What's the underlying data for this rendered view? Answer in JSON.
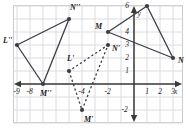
{
  "figure": {
    "type": "coordinate-geometry-diagram",
    "background_color": "#ffffff",
    "grid_color": "#d8d8dc",
    "border_color": "#c9c9cf",
    "axis_color": "#3a3a3a",
    "shape_color": "#3c3c44",
    "label_color": "#1a1a1a",
    "x_axis_label": "x",
    "y_axis_label": "y",
    "x_ticks": [
      "-9",
      "-8",
      "-4",
      "-2",
      "1",
      "2",
      "3"
    ],
    "y_ticks": [
      "6",
      "4",
      "3",
      "2",
      "1",
      "-2"
    ],
    "x_range": [
      -10,
      4
    ],
    "y_range": [
      -3,
      7
    ],
    "origin_px": [
      134,
      84
    ],
    "unit_px": 13.0
  },
  "triangles": [
    {
      "name": "triangle-LMN",
      "style": "solid",
      "vertices": [
        {
          "label": "L",
          "x": 1,
          "y": 6,
          "label_dx": 5,
          "label_dy": -11
        },
        {
          "label": "M",
          "x": -2,
          "y": 4,
          "label_dx": -13,
          "label_dy": -5
        },
        {
          "label": "N",
          "x": 3,
          "y": 2,
          "label_dx": 5,
          "label_dy": 3
        }
      ]
    },
    {
      "name": "triangle-L-prime-M-prime-N-prime",
      "style": "dashed",
      "vertices": [
        {
          "label": "L'",
          "x": -5,
          "y": 1,
          "label_dx": -2,
          "label_dy": -12
        },
        {
          "label": "M'",
          "x": -4,
          "y": -2,
          "label_dx": 2,
          "label_dy": 10
        },
        {
          "label": "N'",
          "x": -2,
          "y": 3,
          "label_dx": 4,
          "label_dy": 4
        }
      ]
    },
    {
      "name": "triangle-L-double-prime-M-double-prime-N-double-prime",
      "style": "solid",
      "vertices": [
        {
          "label": "L''",
          "x": -9,
          "y": 3,
          "label_dx": -14,
          "label_dy": -4
        },
        {
          "label": "M''",
          "x": -7,
          "y": 0,
          "label_dx": -3,
          "label_dy": 10
        },
        {
          "label": "N''",
          "x": -5,
          "y": 5,
          "label_dx": 1,
          "label_dy": -11
        }
      ]
    }
  ]
}
